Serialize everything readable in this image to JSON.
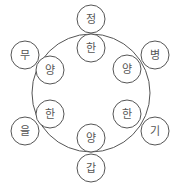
{
  "diagram": {
    "type": "cycle-diagram",
    "stroke_color": "#555555",
    "background": "#ffffff",
    "ring": {
      "cx": 91,
      "cy": 93,
      "r": 59
    },
    "node_radius": 14,
    "nodes": [
      {
        "id": "outer-top",
        "label": "정",
        "cx": 91,
        "cy": 19,
        "position": "outer"
      },
      {
        "id": "inner-top",
        "label": "한",
        "cx": 91,
        "cy": 48,
        "position": "inner"
      },
      {
        "id": "outer-top-left",
        "label": "무",
        "cx": 25,
        "cy": 55,
        "position": "outer"
      },
      {
        "id": "inner-top-left",
        "label": "양",
        "cx": 50,
        "cy": 70,
        "position": "inner"
      },
      {
        "id": "outer-top-right",
        "label": "병",
        "cx": 155,
        "cy": 55,
        "position": "outer"
      },
      {
        "id": "inner-top-right",
        "label": "양",
        "cx": 127,
        "cy": 69,
        "position": "inner"
      },
      {
        "id": "outer-bottom-left",
        "label": "을",
        "cx": 25,
        "cy": 131,
        "position": "outer"
      },
      {
        "id": "inner-bottom-left",
        "label": "한",
        "cx": 50,
        "cy": 114,
        "position": "inner"
      },
      {
        "id": "outer-bottom-right",
        "label": "기",
        "cx": 155,
        "cy": 131,
        "position": "outer"
      },
      {
        "id": "inner-bottom-right",
        "label": "한",
        "cx": 127,
        "cy": 114,
        "position": "inner"
      },
      {
        "id": "inner-bottom",
        "label": "양",
        "cx": 91,
        "cy": 138,
        "position": "inner"
      },
      {
        "id": "outer-bottom",
        "label": "갑",
        "cx": 91,
        "cy": 168,
        "position": "outer"
      }
    ]
  }
}
